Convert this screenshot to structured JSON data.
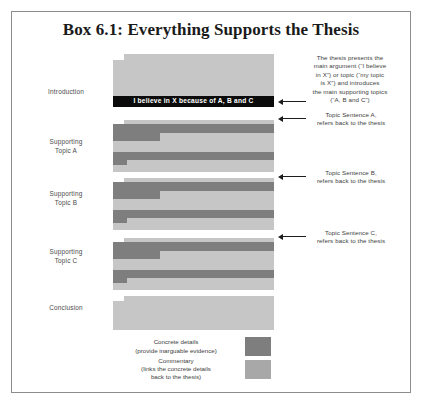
{
  "box": {
    "title": "Box 6.1: Everything Supports the Thesis"
  },
  "sections": [
    {
      "label": "Introduction"
    },
    {
      "label": "Supporting\nTopic A"
    },
    {
      "label": "Supporting\nTopic B"
    },
    {
      "label": "Supporting\nTopic C"
    },
    {
      "label": "Conclusion"
    }
  ],
  "section_labels": {
    "introduction": "Introduction",
    "topic_a_line1": "Supporting",
    "topic_a_line2": "Topic A",
    "topic_b_line1": "Supporting",
    "topic_b_line2": "Topic B",
    "topic_c_line1": "Supporting",
    "topic_c_line2": "Topic C",
    "conclusion": "Conclusion"
  },
  "thesis_bar": {
    "text": "I believe in X because of A, B and C"
  },
  "annotations": {
    "thesis": {
      "line1": "The thesis presents the",
      "line2": "main argument (“I believe",
      "line3": "in X”) or topic (“my topic",
      "line4": "is X”) and introduces",
      "line5": "the main supporting topics",
      "line6": "(“A, B and C”)"
    },
    "topic_a": {
      "line1": "Topic Sentence A,",
      "line2": "refers back to the thesis"
    },
    "topic_b": {
      "line1": "Topic Sentence B,",
      "line2": "refers back to the thesis"
    },
    "topic_c": {
      "line1": "Topic Sentence C,",
      "line2": "refers back to the thesis"
    }
  },
  "legend": {
    "concrete": {
      "line1": "Concrete details",
      "line2": "(provide inarguable evidence)"
    },
    "commentary": {
      "line1": "Commentary",
      "line2": "(links the concrete details",
      "line3": "back to the thesis)"
    }
  },
  "colors": {
    "concrete": "#7e7e7e",
    "commentary": "#c6c6c6",
    "commentary_swatch": "#a8a8a8",
    "thesis_bar": "#0b0b0b",
    "frame_border": "#8d8d8d",
    "page_background": "#ffffff"
  }
}
